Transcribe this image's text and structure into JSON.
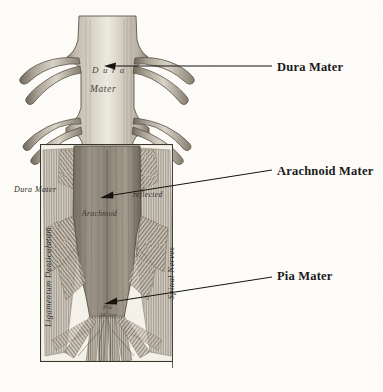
{
  "figure": {
    "background_color": "#fdfcf8",
    "ink_color": "#3b3732"
  },
  "callouts": [
    {
      "id": "dura",
      "label": "Dura Mater",
      "x": 277,
      "y": 60
    },
    {
      "id": "arachnoid",
      "label": "Arachnoid Mater",
      "x": 277,
      "y": 164
    },
    {
      "id": "pia",
      "label": "Pia Mater",
      "x": 277,
      "y": 269
    }
  ],
  "leader_lines": [
    {
      "id": "dura",
      "x1": 272,
      "y1": 66,
      "x2": 112,
      "y2": 66
    },
    {
      "id": "arachnoid",
      "x1": 272,
      "y1": 170,
      "x2": 106,
      "y2": 196
    },
    {
      "id": "pia",
      "x1": 272,
      "y1": 277,
      "x2": 110,
      "y2": 302
    }
  ],
  "engraving_labels": {
    "dura_top_line1": "D u r a",
    "dura_top_line2": "Mater",
    "dura_left": "Dura Mater",
    "reflected": "reflected",
    "arachnoid": "Arachnoid",
    "pia_line1": "Pia",
    "pia_line2": "Mater",
    "ligamentum": "Ligamentum Denticulatum",
    "spinal_nerves": "Spinal Nerves"
  }
}
